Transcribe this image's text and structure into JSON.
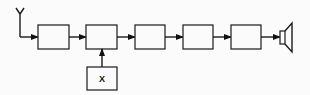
{
  "diagram": {
    "type": "block-diagram",
    "blocks": [
      {
        "id": "b1",
        "label": ""
      },
      {
        "id": "b2",
        "label": ""
      },
      {
        "id": "b3",
        "label": ""
      },
      {
        "id": "b4",
        "label": ""
      },
      {
        "id": "b5",
        "label": ""
      },
      {
        "id": "bx",
        "label": "X"
      }
    ],
    "input": "antenna",
    "output": "loudspeaker",
    "connections": [
      [
        "antenna",
        "b1"
      ],
      [
        "b1",
        "b2"
      ],
      [
        "b2",
        "b3"
      ],
      [
        "b3",
        "b4"
      ],
      [
        "b4",
        "b5"
      ],
      [
        "b5",
        "loudspeaker"
      ],
      [
        "bx",
        "b2"
      ]
    ],
    "colors": {
      "line": "#1a1a1a",
      "background": "#fbfbfb"
    }
  }
}
